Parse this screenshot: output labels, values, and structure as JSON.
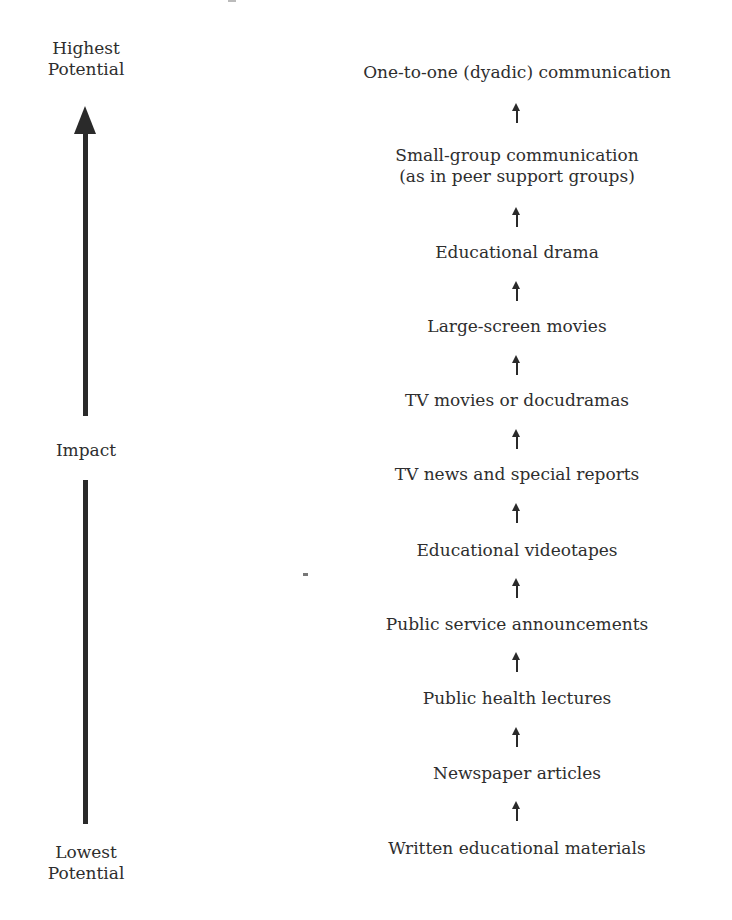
{
  "diagram": {
    "axis": {
      "top_label_line1": "Highest",
      "top_label_line2": "Potential",
      "middle_label": "Impact",
      "bottom_label_line1": "Lowest",
      "bottom_label_line2": "Potential",
      "direction": "upward",
      "color": "#2a2a2a"
    },
    "hierarchy": [
      {
        "line1": "One-to-one (dyadic) communication"
      },
      {
        "line1": "Small-group communication",
        "line2": "(as in peer support groups)"
      },
      {
        "line1": "Educational drama"
      },
      {
        "line1": "Large-screen movies"
      },
      {
        "line1": "TV movies or docudramas"
      },
      {
        "line1": "TV news and special reports"
      },
      {
        "line1": "Educational videotapes"
      },
      {
        "line1": "Public service announcements"
      },
      {
        "line1": "Public health lectures"
      },
      {
        "line1": "Newspaper articles"
      },
      {
        "line1": "Written educational materials"
      }
    ],
    "connector_icon": "up-arrow-icon"
  }
}
